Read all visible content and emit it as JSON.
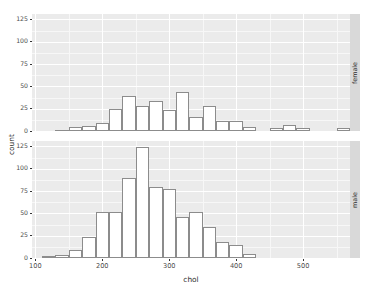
{
  "chart_data": {
    "type": "bar",
    "chart_kind": "faceted histogram",
    "title": "",
    "xlabel": "chol",
    "ylabel": "count",
    "xlim": [
      95,
      570
    ],
    "ylim": [
      0,
      131
    ],
    "xticks": [
      100,
      200,
      300,
      400,
      500
    ],
    "yticks": [
      0,
      25,
      50,
      75,
      100,
      125
    ],
    "grid": true,
    "legend_position": "none",
    "binwidth": 20,
    "facet_variable": "sex",
    "facets": [
      {
        "label": "female",
        "position": "top",
        "series": [
          {
            "name": "female",
            "bins": [
              {
                "x": 140,
                "count": 1
              },
              {
                "x": 160,
                "count": 4
              },
              {
                "x": 180,
                "count": 6
              },
              {
                "x": 200,
                "count": 9
              },
              {
                "x": 220,
                "count": 25
              },
              {
                "x": 240,
                "count": 39
              },
              {
                "x": 260,
                "count": 28
              },
              {
                "x": 280,
                "count": 34
              },
              {
                "x": 300,
                "count": 23
              },
              {
                "x": 320,
                "count": 44
              },
              {
                "x": 340,
                "count": 16
              },
              {
                "x": 360,
                "count": 28
              },
              {
                "x": 380,
                "count": 11
              },
              {
                "x": 400,
                "count": 11
              },
              {
                "x": 420,
                "count": 4
              },
              {
                "x": 460,
                "count": 3
              },
              {
                "x": 480,
                "count": 7
              },
              {
                "x": 500,
                "count": 3
              },
              {
                "x": 560,
                "count": 3
              }
            ]
          }
        ]
      },
      {
        "label": "male",
        "position": "bottom",
        "series": [
          {
            "name": "male",
            "bins": [
              {
                "x": 120,
                "count": 2
              },
              {
                "x": 140,
                "count": 3
              },
              {
                "x": 160,
                "count": 9
              },
              {
                "x": 180,
                "count": 23
              },
              {
                "x": 200,
                "count": 52
              },
              {
                "x": 220,
                "count": 52
              },
              {
                "x": 240,
                "count": 90
              },
              {
                "x": 260,
                "count": 124
              },
              {
                "x": 280,
                "count": 79
              },
              {
                "x": 300,
                "count": 77
              },
              {
                "x": 320,
                "count": 46
              },
              {
                "x": 340,
                "count": 52
              },
              {
                "x": 360,
                "count": 35
              },
              {
                "x": 380,
                "count": 18
              },
              {
                "x": 400,
                "count": 14
              },
              {
                "x": 420,
                "count": 5
              }
            ]
          }
        ]
      }
    ]
  }
}
